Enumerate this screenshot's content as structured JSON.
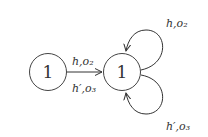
{
  "diagram": {
    "nodes": [
      {
        "id": "left",
        "label": "1"
      },
      {
        "id": "right",
        "label": "1"
      }
    ],
    "edges": [
      {
        "from": "left",
        "to": "right",
        "label_top": "h,o₂",
        "label_bottom": "h′,o₃"
      },
      {
        "from": "right",
        "to": "right",
        "label": "h,o₂",
        "position": "top"
      },
      {
        "from": "right",
        "to": "right",
        "label": "h′,o₃",
        "position": "bottom"
      }
    ]
  }
}
